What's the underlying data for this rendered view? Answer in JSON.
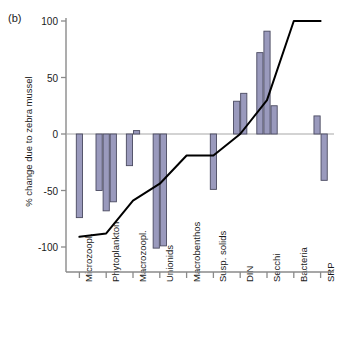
{
  "panel": {
    "label": "(b)"
  },
  "chart_data": {
    "type": "bar",
    "title": "",
    "subtitle": "",
    "panel_label": "(b)",
    "xlabel": "",
    "ylabel": "% change due to zebra mussel",
    "ylim": [
      -110,
      105
    ],
    "yticks": [
      100,
      50,
      0,
      -50,
      -100
    ],
    "ytick_labels": [
      "100",
      "50",
      "0",
      "-50",
      "-100"
    ],
    "grid": false,
    "legend": "none",
    "zero_line": true,
    "categories": [
      "Microzoopl.",
      "Phytoplankton",
      "Macrozoopl.",
      "Unionids",
      "Macrobenthos",
      "Susp. solids",
      "DIN",
      "Secchi",
      "Bacteria",
      "SRP"
    ],
    "bar_groups": [
      {
        "category": "Microzoopl.",
        "values": [
          -74
        ]
      },
      {
        "category": "Phytoplankton",
        "values": [
          -50,
          -68,
          -60
        ]
      },
      {
        "category": "Macrozoopl.",
        "values": [
          -28,
          3
        ]
      },
      {
        "category": "Unionids",
        "values": [
          -101,
          -99
        ]
      },
      {
        "category": "Macrobenthos",
        "values": []
      },
      {
        "category": "Susp. solids",
        "values": [
          -49
        ]
      },
      {
        "category": "DIN",
        "values": [
          29,
          36
        ]
      },
      {
        "category": "Secchi",
        "values": [
          72,
          91,
          25
        ]
      },
      {
        "category": "Bacteria",
        "values": []
      },
      {
        "category": "SRP",
        "values": [
          16,
          -41
        ]
      }
    ],
    "series": [
      {
        "name": "bars",
        "type": "bar",
        "color": "#9a9abd",
        "edge_color": "#4a4a60",
        "values_flat": [
          -74,
          -50,
          -68,
          -60,
          -28,
          3,
          -101,
          -99,
          -49,
          29,
          36,
          72,
          91,
          25,
          16,
          -41
        ]
      },
      {
        "name": "cumulative-line",
        "type": "line",
        "color": "#000000",
        "x": [
          "Microzoopl.",
          "Phytoplankton",
          "Macrozoopl.",
          "Unionids",
          "Macrobenthos",
          "Susp. solids",
          "DIN",
          "Secchi",
          "Bacteria",
          "SRP"
        ],
        "values": [
          -91,
          -88,
          -59,
          -44,
          -19,
          -19,
          0,
          30,
          100,
          100
        ]
      }
    ]
  },
  "axis_colors": {
    "axis": "#8a8a8a",
    "bar_fill": "#9a9abd",
    "bar_edge": "#4a4a60",
    "line": "#000000",
    "text": "#1a1a1a"
  }
}
